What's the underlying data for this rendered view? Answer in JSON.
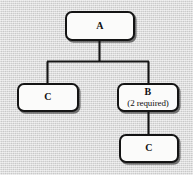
{
  "diagram": {
    "type": "tree",
    "title": "",
    "background_color": "#d9d9d9",
    "node_fill_color": "#fbfbfa",
    "node_border_color": "#141414",
    "edge_color": "#141414",
    "nodes": [
      {
        "id": "a",
        "label": "A",
        "sublabel": "",
        "name": "node-a"
      },
      {
        "id": "c1",
        "label": "C",
        "sublabel": "",
        "name": "node-c-left"
      },
      {
        "id": "b",
        "label": "B",
        "sublabel": "(2 required)",
        "name": "node-b"
      },
      {
        "id": "c2",
        "label": "C",
        "sublabel": "",
        "name": "node-c-bottom"
      }
    ],
    "edges": [
      {
        "from": "a",
        "to": "c1"
      },
      {
        "from": "a",
        "to": "b"
      },
      {
        "from": "b",
        "to": "c2"
      }
    ]
  }
}
